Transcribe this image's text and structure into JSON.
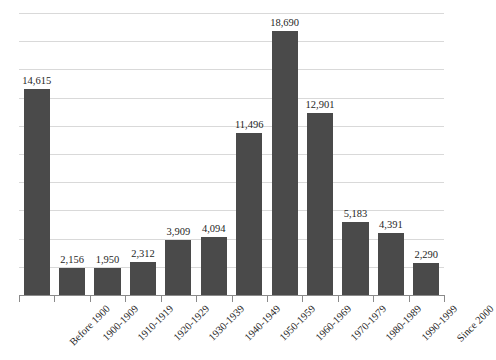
{
  "chart_data": {
    "type": "bar",
    "title": "",
    "subtitle": "",
    "xlabel": "",
    "ylabel": "",
    "categories": [
      "Before 1900",
      "1900-1909",
      "1910-1919",
      "1920-1929",
      "1930-1939",
      "1940-1949",
      "1950-1959",
      "1960-1969",
      "1970-1979",
      "1980-1989",
      "1990-1999",
      "Since 2000"
    ],
    "values": [
      14615,
      1950,
      1950,
      2312,
      3909,
      4094,
      11496,
      18690,
      12901,
      5183,
      4391,
      2290
    ],
    "data_labels": [
      "14,615",
      "2,156",
      "1,950",
      "2,312",
      "3,909",
      "4,094",
      "11,496",
      "18,690",
      "12,901",
      "5,183",
      "4,391",
      "2,290"
    ],
    "ylim": [
      0,
      20000
    ],
    "gridlines": [
      2000,
      4000,
      6000,
      8000,
      10000,
      12000,
      14000,
      16000,
      18000,
      20000
    ],
    "grid": true,
    "y_tick_labels_visible": false,
    "legend": false,
    "legend_position": "none",
    "bar_color": "#4a4a4a",
    "gridline_color": "#d9d9d9",
    "axis_color": "#8a8a8a",
    "label_color": "#262626",
    "category_label_rotation": -45
  }
}
